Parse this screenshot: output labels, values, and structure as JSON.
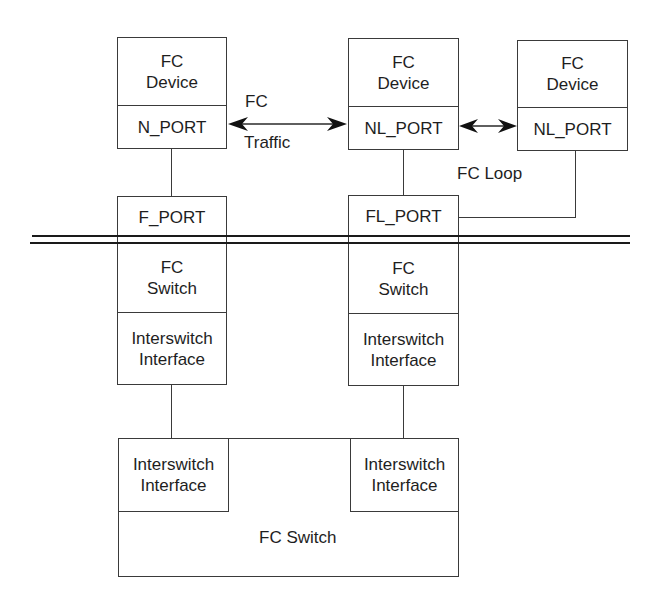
{
  "devices": [
    {
      "title_line1": "FC",
      "title_line2": "Device",
      "port": "N_PORT"
    },
    {
      "title_line1": "FC",
      "title_line2": "Device",
      "port": "NL_PORT"
    },
    {
      "title_line1": "FC",
      "title_line2": "Device",
      "port": "NL_PORT"
    }
  ],
  "traffic_label": {
    "line1": "FC",
    "line2": "Traffic"
  },
  "loop_label": "FC Loop",
  "switches": [
    {
      "port": "F_PORT",
      "title_line1": "FC",
      "title_line2": "Switch",
      "interface_line1": "Interswitch",
      "interface_line2": "Interface"
    },
    {
      "port": "FL_PORT",
      "title_line1": "FC",
      "title_line2": "Switch",
      "interface_line1": "Interswitch",
      "interface_line2": "Interface"
    }
  ],
  "bottom_switch": {
    "label": "FC Switch",
    "interfaces": [
      {
        "line1": "Interswitch",
        "line2": "Interface"
      },
      {
        "line1": "Interswitch",
        "line2": "Interface"
      }
    ]
  },
  "colors": {
    "line": "#3a3a3a",
    "text": "#1e1e1e",
    "background": "#ffffff"
  }
}
